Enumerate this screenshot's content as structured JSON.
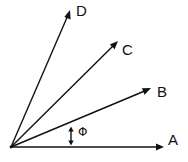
{
  "diagram": {
    "origin": {
      "x": 11,
      "y": 147
    },
    "colors": {
      "stroke": "#111111",
      "background": "#ffffff"
    },
    "vectors": [
      {
        "id": "A",
        "label": "A",
        "tip": {
          "x": 164,
          "y": 147
        },
        "label_pos": {
          "x": 168,
          "y": 145
        }
      },
      {
        "id": "B",
        "label": "B",
        "tip": {
          "x": 151,
          "y": 88
        },
        "label_pos": {
          "x": 157,
          "y": 97
        }
      },
      {
        "id": "C",
        "label": "C",
        "tip": {
          "x": 118,
          "y": 41
        },
        "label_pos": {
          "x": 122,
          "y": 55
        }
      },
      {
        "id": "D",
        "label": "D",
        "tip": {
          "x": 70,
          "y": 10
        },
        "label_pos": {
          "x": 76,
          "y": 16
        }
      }
    ],
    "angle_marker": {
      "symbol": "Φ",
      "x": 71,
      "y_top": 127,
      "y_bottom": 145,
      "label_pos": {
        "x": 78,
        "y": 136
      }
    }
  }
}
